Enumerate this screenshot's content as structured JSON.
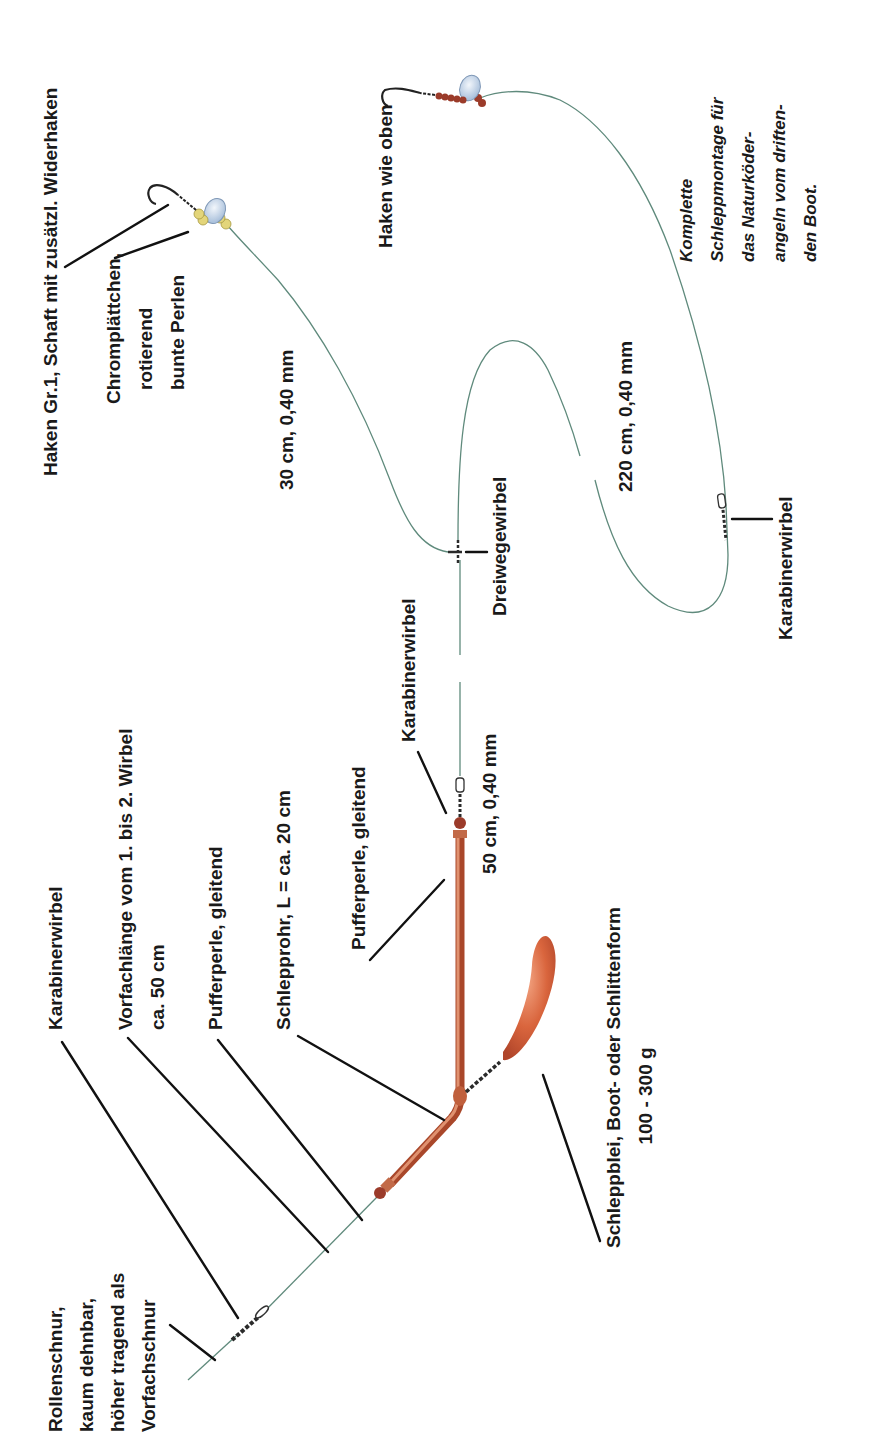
{
  "diagram": {
    "orientation": "rotated 90° counter-clockwise",
    "caption": {
      "lines": [
        "Komplette",
        "Schleppmontage für",
        "das Naturköder-",
        "angeln vom driften-",
        "den Boot."
      ]
    },
    "labels": {
      "rollenschnur": [
        "Rollenschnur,",
        "kaum dehnbar,",
        "höher tragend als",
        "Vorfachschnur"
      ],
      "karabinerwirbel_1": "Karabinerwirbel",
      "vorfachlaenge": [
        "Vorfachlänge vom 1. bis 2. Wirbel",
        "ca. 50 cm"
      ],
      "pufferperle_1": "Pufferperle, gleitend",
      "schlepprohr": "Schlepprohr, L = ca. 20 cm",
      "pufferperle_2": "Pufferperle, gleitend",
      "karabinerwirbel_2": "Karabinerwirbel",
      "schleppblei": [
        "Schleppblei, Boot- oder Schlittenform",
        "100 - 300 g"
      ],
      "segment_50": "50 cm, 0,40 mm",
      "dreiwegewirbel": "Dreiwegewirbel",
      "segment_30": "30 cm, 0,40 mm",
      "chromplaettchen": [
        "Chromplättchen,",
        "rotierend",
        "bunte Perlen"
      ],
      "haken": "Haken Gr.1,  Schaft mit zusätzl. Widerhaken",
      "segment_220": "220 cm, 0,40 mm",
      "karabinerwirbel_3": "Karabinerwirbel",
      "haken_wie_oben": "Haken wie oben"
    },
    "colors": {
      "line": "#5f8a7c",
      "tube": "#a9472a",
      "sinker": "#d0613a",
      "bead_yellow": "#e3d57a",
      "bead_red": "#9b3b2a",
      "blade": "#c9d9ec",
      "leader": "#111111"
    }
  }
}
